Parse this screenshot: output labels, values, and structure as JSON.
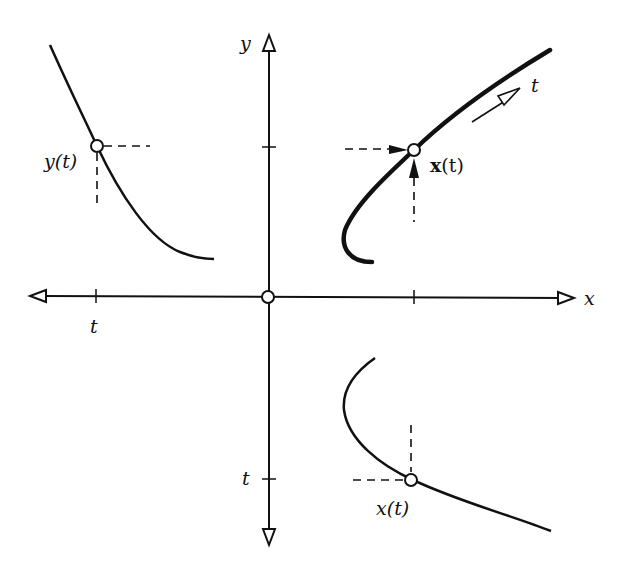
{
  "diagram": {
    "title": "",
    "axes": {
      "x_label": "x",
      "y_label": "y",
      "x_tick_label": "t",
      "y_tick_label": "t",
      "origin_marker": "open-circle"
    },
    "panels": [
      {
        "name": "curve-x-of-t",
        "quadrant": "upper-right",
        "point_label_bold": "x",
        "point_label_rest": "(t)",
        "direction_label": "t"
      },
      {
        "name": "graph-y-of-t",
        "quadrant": "upper-left",
        "point_label_italic": "y",
        "point_label_rest": "(t)"
      },
      {
        "name": "graph-x-of-t",
        "quadrant": "lower-right",
        "point_label_italic": "x",
        "point_label_rest": "(t)"
      }
    ],
    "colors": {
      "ink": "#111111",
      "background": "#ffffff"
    }
  }
}
